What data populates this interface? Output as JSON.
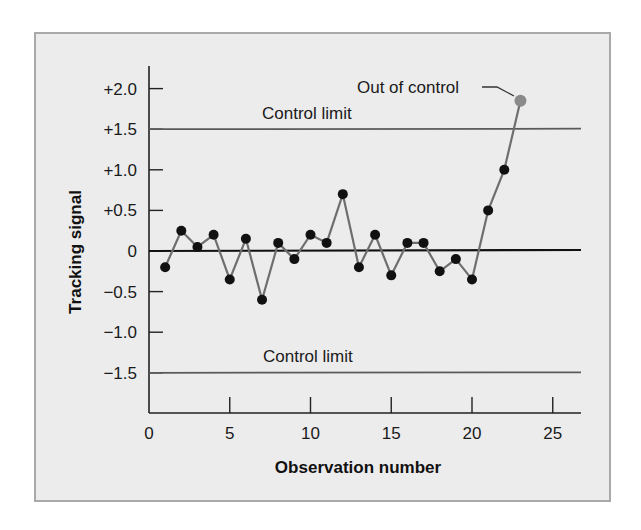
{
  "chart_data": {
    "type": "line",
    "title": "",
    "xlabel": "Observation number",
    "ylabel": "Tracking signal",
    "xlim": [
      0,
      27
    ],
    "ylim": [
      -1.95,
      2.35
    ],
    "x_ticks": [
      0,
      5,
      10,
      15,
      20,
      25
    ],
    "x_tick_labels": [
      "0",
      "5",
      "10",
      "15",
      "20",
      "25"
    ],
    "y_ticks": [
      2.0,
      1.5,
      1.0,
      0.5,
      0,
      -0.5,
      -1.0,
      -1.5
    ],
    "y_tick_labels": [
      "+2.0",
      "+1.5",
      "+1.0",
      "+0.5",
      "0",
      "−0.5",
      "−1.0",
      "−1.5"
    ],
    "grid": false,
    "legend": null,
    "series": [
      {
        "name": "Tracking signal",
        "x": [
          1,
          2,
          3,
          4,
          5,
          6,
          7,
          8,
          9,
          10,
          11,
          12,
          13,
          14,
          15,
          16,
          17,
          18,
          19,
          20,
          21,
          22,
          23
        ],
        "values": [
          -0.2,
          0.25,
          0.05,
          0.2,
          -0.35,
          0.15,
          -0.6,
          0.1,
          -0.1,
          0.2,
          0.1,
          0.7,
          -0.2,
          0.2,
          -0.3,
          0.1,
          0.1,
          -0.25,
          -0.1,
          -0.35,
          0.5,
          1.0,
          1.85
        ],
        "line_color": "#6e6e6e",
        "marker_color": "#111111"
      }
    ],
    "reference_lines": [
      {
        "name": "upper-control-limit",
        "y": 1.5,
        "label": "Control limit",
        "color": "#5a5a5a"
      },
      {
        "name": "lower-control-limit",
        "y": -1.5,
        "label": "Control limit",
        "color": "#5a5a5a"
      },
      {
        "name": "zero-line",
        "y": 0,
        "label": "",
        "color": "#111111"
      }
    ],
    "annotations": [
      {
        "text": "Out of control",
        "x": 23,
        "y": 1.85,
        "marker_color": "#8a8a8a"
      }
    ]
  },
  "labels": {
    "out_of_control": "Out of control",
    "upper_limit": "Control limit",
    "lower_limit": "Control limit",
    "xlabel": "Observation number",
    "ylabel": "Tracking signal"
  },
  "colors": {
    "panel_bg": "#ececec",
    "panel_border": "#a9a9a9",
    "axis": "#222222",
    "series_line": "#6e6e6e",
    "marker": "#111111",
    "out_of_control_marker": "#8a8a8a"
  }
}
